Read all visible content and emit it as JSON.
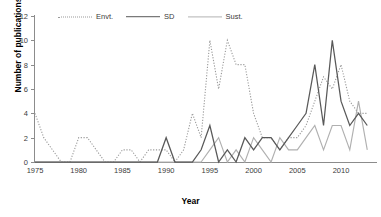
{
  "chart_data": {
    "type": "line",
    "title": "",
    "xlabel": "Year",
    "ylabel": "Number of publications",
    "xlim": [
      1975,
      2014
    ],
    "ylim": [
      0,
      12
    ],
    "ytick_labels": [
      "0",
      "2",
      "4",
      "6",
      "8",
      "10",
      "12"
    ],
    "yticks": [
      0,
      2,
      4,
      6,
      8,
      10,
      12
    ],
    "xtick_labels": [
      "1975",
      "1980",
      "1985",
      "1990",
      "1995",
      "2000",
      "2005",
      "2010"
    ],
    "xticks": [
      1975,
      1980,
      1985,
      1990,
      1995,
      2000,
      2005,
      2010
    ],
    "grid": false,
    "legend_position": "top-center",
    "x": [
      1975,
      1976,
      1977,
      1978,
      1979,
      1980,
      1981,
      1982,
      1983,
      1984,
      1985,
      1986,
      1987,
      1988,
      1989,
      1990,
      1991,
      1992,
      1993,
      1994,
      1995,
      1996,
      1997,
      1998,
      1999,
      2000,
      2001,
      2002,
      2003,
      2004,
      2005,
      2006,
      2007,
      2008,
      2009,
      2010,
      2011,
      2012,
      2013
    ],
    "series": [
      {
        "name": "Envt.",
        "style": "dotted",
        "color": "#9a9a9a",
        "values": [
          4,
          2,
          1,
          0,
          0,
          2,
          2,
          1,
          0,
          0,
          1,
          1,
          0,
          1,
          1,
          1,
          0,
          1,
          4,
          2,
          10,
          6,
          10,
          8,
          8,
          4,
          2,
          2,
          1,
          2,
          2,
          3,
          5,
          7,
          6,
          8,
          5,
          4,
          4
        ]
      },
      {
        "name": "SD",
        "style": "solid",
        "color": "#595959",
        "values": [
          0,
          0,
          0,
          0,
          0,
          0,
          0,
          0,
          0,
          0,
          0,
          0,
          0,
          0,
          0,
          2,
          0,
          0,
          0,
          1,
          3,
          0,
          1,
          0,
          2,
          1,
          2,
          2,
          1,
          2,
          3,
          4,
          8,
          3,
          10,
          5,
          3,
          4,
          3
        ]
      },
      {
        "name": "Sust.",
        "style": "solid",
        "color": "#b0b0b0",
        "values": [
          0,
          0,
          0,
          0,
          0,
          0,
          0,
          0,
          0,
          0,
          0,
          0,
          0,
          0,
          0,
          0,
          0,
          0,
          0,
          0,
          1,
          2,
          0,
          1,
          0,
          2,
          1,
          0,
          2,
          1,
          1,
          2,
          3,
          1,
          3,
          3,
          1,
          5,
          1
        ]
      }
    ]
  },
  "legend": {
    "items": [
      {
        "label": "Envt."
      },
      {
        "label": "SD"
      },
      {
        "label": "Sust."
      }
    ]
  },
  "axes": {
    "ylabel": "Number of publications",
    "xlabel": "Year"
  }
}
